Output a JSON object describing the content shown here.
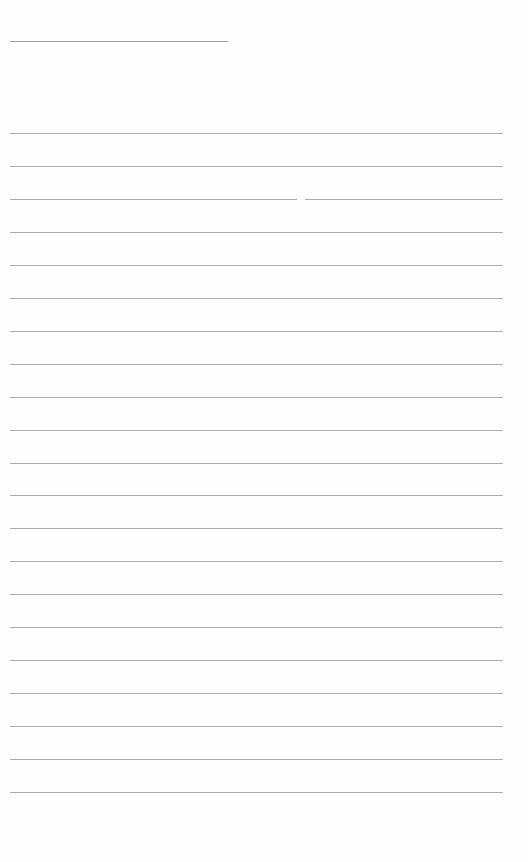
{
  "document": {
    "type": "lined-paper",
    "background_color": "#fefefe",
    "line_color": "#9a9a9a",
    "header_line": {
      "x": 10,
      "y": 41,
      "width": 218
    },
    "ruled_lines": {
      "count": 21,
      "start_y": 133,
      "spacing": 32.95,
      "x": 10,
      "width": 493
    },
    "text": []
  }
}
